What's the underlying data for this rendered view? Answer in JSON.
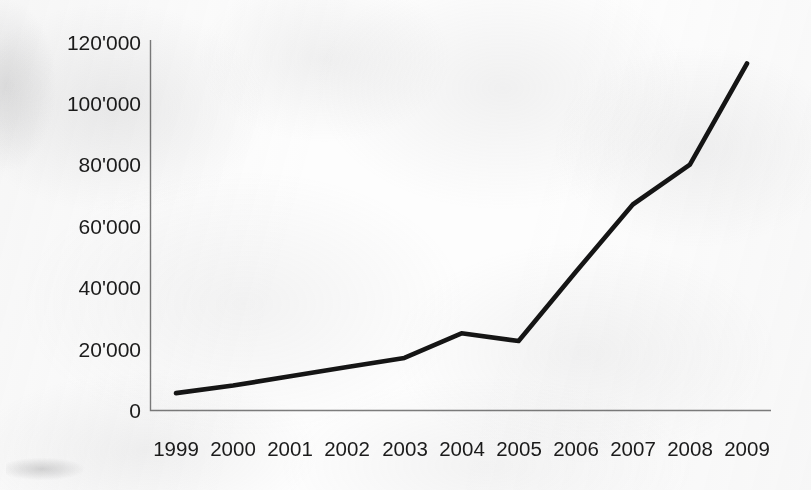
{
  "chart_data": {
    "type": "line",
    "title": "",
    "subtitle": "",
    "xlabel": "",
    "ylabel": "",
    "categories": [
      "1999",
      "2000",
      "2001",
      "2002",
      "2003",
      "2004",
      "2005",
      "2006",
      "2007",
      "2008",
      "2009"
    ],
    "values": [
      5500,
      8000,
      11000,
      14000,
      17000,
      25000,
      22500,
      45000,
      67000,
      80000,
      113000
    ],
    "series": [
      {
        "name": "",
        "values": [
          5500,
          8000,
          11000,
          14000,
          17000,
          25000,
          22500,
          45000,
          67000,
          80000,
          113000
        ]
      }
    ],
    "ylim": [
      0,
      120000
    ],
    "ytick_values": [
      0,
      20000,
      40000,
      60000,
      80000,
      100000,
      120000
    ],
    "ytick_labels": [
      "0",
      "20'000",
      "40'000",
      "60'000",
      "80'000",
      "100'000",
      "120'000"
    ],
    "xtick_labels": [
      "1999",
      "2000",
      "2001",
      "2002",
      "2003",
      "2004",
      "2005",
      "2006",
      "2007",
      "2008",
      "2009"
    ],
    "grid": false,
    "legend": false,
    "legend_position": "none",
    "line_color": "#151515",
    "axis_color": "#7d7d7d",
    "background_color": "#fdfdfd",
    "annotations": []
  },
  "axes": {
    "y_axis_name": "y-axis",
    "x_axis_name": "x-axis"
  }
}
